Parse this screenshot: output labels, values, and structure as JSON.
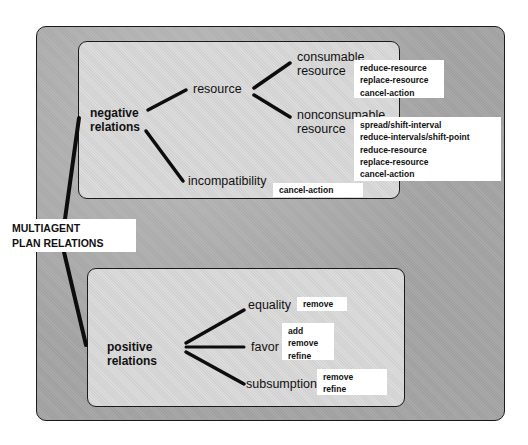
{
  "diagram": {
    "root": {
      "line1": "MULTIAGENT",
      "line2": "PLAN RELATIONS"
    },
    "negative": {
      "label_line1": "negative",
      "label_line2": "relations",
      "resource": {
        "label": "resource",
        "consumable": {
          "label_line1": "consumable",
          "label_line2": "resource",
          "actions": [
            "reduce-resource",
            "replace-resource",
            "cancel-action"
          ]
        },
        "nonconsumable": {
          "label_line1": "nonconsumable",
          "label_line2": "resource",
          "actions": [
            "spread/shift-interval",
            "reduce-intervals/shift-point",
            "reduce-resource",
            "replace-resource",
            "cancel-action"
          ]
        }
      },
      "incompatibility": {
        "label": "incompatibility",
        "actions": [
          "cancel-action"
        ]
      }
    },
    "positive": {
      "label_line1": "positive",
      "label_line2": "relations",
      "equality": {
        "label": "equality",
        "actions": [
          "remove"
        ]
      },
      "favor": {
        "label": "favor",
        "actions": [
          "add",
          "remove",
          "refine"
        ]
      },
      "subsumption": {
        "label": "subsumption",
        "actions": [
          "remove",
          "refine"
        ]
      }
    }
  }
}
